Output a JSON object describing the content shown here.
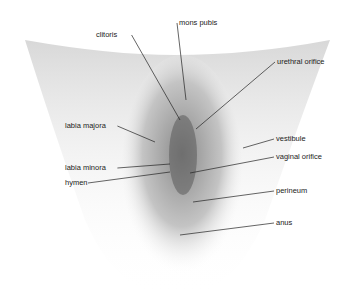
{
  "diagram": {
    "type": "anatomical-illustration",
    "style": "grayscale medical drawing with leader lines",
    "labels": [
      {
        "id": "mons-pubis",
        "text": "mons pubis",
        "x": 179,
        "y": 23,
        "anchor": [
          186,
          100
        ]
      },
      {
        "id": "clitoris",
        "text": "clitoris",
        "x": 96,
        "y": 35,
        "anchor": [
          180,
          120
        ]
      },
      {
        "id": "urethral-orifice",
        "text": "urethral orifice",
        "x": 277,
        "y": 62,
        "anchor": [
          196,
          129
        ]
      },
      {
        "id": "labia-majora",
        "text": "labia majora",
        "x": 65,
        "y": 126,
        "anchor": [
          155,
          142
        ]
      },
      {
        "id": "vestibule",
        "text": "vestibule",
        "x": 276,
        "y": 139,
        "anchor": [
          243,
          148
        ]
      },
      {
        "id": "labia-minora",
        "text": "labia minora",
        "x": 65,
        "y": 168,
        "anchor": [
          170,
          164
        ]
      },
      {
        "id": "vaginal-orifice",
        "text": "vaginal orifice",
        "x": 276,
        "y": 157,
        "anchor": [
          190,
          173
        ]
      },
      {
        "id": "hymen",
        "text": "hymen",
        "x": 65,
        "y": 183,
        "anchor": [
          170,
          172
        ]
      },
      {
        "id": "perineum",
        "text": "perineum",
        "x": 276,
        "y": 191,
        "anchor": [
          193,
          202
        ]
      },
      {
        "id": "anus",
        "text": "anus",
        "x": 276,
        "y": 223,
        "anchor": [
          180,
          235
        ]
      }
    ],
    "colors": {
      "background": "#ffffff",
      "line": "#222222",
      "text": "#222222",
      "shading": "#9a9a9a"
    }
  }
}
